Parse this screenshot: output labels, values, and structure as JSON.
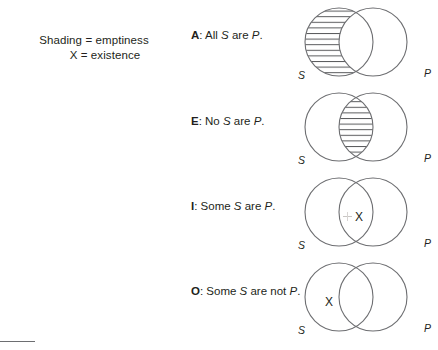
{
  "figure": {
    "background_color": "#ffffff",
    "stroke_color": "#6d6e71",
    "text_color": "#231f20"
  },
  "legend": {
    "line_1": "Shading = emptiness",
    "line_2": "X = existence",
    "shading_meaning": "emptiness",
    "x_meaning": "existence"
  },
  "propositions": [
    {
      "letter": "A",
      "separator": ": ",
      "text_before_subject": "All ",
      "subject": "S",
      "text_middle": " are ",
      "predicate": "P",
      "text_after": ".",
      "full_text": "A: All S are P.",
      "diagram": {
        "shaded_region": "s-only",
        "x_region": "none",
        "left_label": "S",
        "right_label": "P"
      }
    },
    {
      "letter": "E",
      "separator": ": ",
      "text_before_subject": "No ",
      "subject": "S",
      "text_middle": " are ",
      "predicate": "P",
      "text_after": ".",
      "full_text": "E: No S are P.",
      "diagram": {
        "shaded_region": "overlap",
        "x_region": "none",
        "left_label": "S",
        "right_label": "P"
      }
    },
    {
      "letter": "I",
      "separator": ": ",
      "text_before_subject": "Some ",
      "subject": "S",
      "text_middle": " are ",
      "predicate": "P",
      "text_after": ".",
      "full_text": "I: Some S are P.",
      "diagram": {
        "shaded_region": "none",
        "x_region": "overlap",
        "x_symbol": "X",
        "left_label": "S",
        "right_label": "P"
      }
    },
    {
      "letter": "O",
      "separator": ": ",
      "text_before_subject": "Some ",
      "subject": "S",
      "text_middle": " are not ",
      "predicate": "P",
      "text_after": ".",
      "full_text": "O: Some S are not P.",
      "diagram": {
        "shaded_region": "none",
        "x_region": "s-only",
        "x_symbol": "X",
        "left_label": "S",
        "right_label": "P"
      }
    }
  ]
}
